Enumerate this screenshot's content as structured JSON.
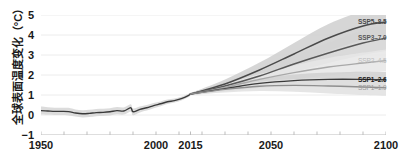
{
  "chart_data": {
    "type": "line",
    "title": "全球表面温度变化（°C）",
    "ylabel": "全球表面温度变化（°C）",
    "xlabel": "",
    "units": "°C",
    "xlim": [
      1950,
      2100
    ],
    "ylim": [
      -1,
      5
    ],
    "grid": true,
    "legend_position": "right",
    "x_ticks": [
      {
        "value": 1950,
        "label": "1950"
      },
      {
        "value": 2000,
        "label": "2000"
      },
      {
        "value": 2015,
        "label": "2015"
      },
      {
        "value": 2050,
        "label": "2050"
      },
      {
        "value": 2100,
        "label": "2100"
      }
    ],
    "x_minor_ticks": [
      1960,
      1970,
      1980,
      1990,
      2010,
      2020,
      2030,
      2040,
      2060,
      2070,
      2080,
      2090
    ],
    "y_ticks": [
      {
        "value": 5,
        "label": "5"
      },
      {
        "value": 4,
        "label": "4"
      },
      {
        "value": 3,
        "label": "3"
      },
      {
        "value": 2,
        "label": "2"
      },
      {
        "value": 1,
        "label": "1"
      },
      {
        "value": 0,
        "label": "0"
      },
      {
        "value": -1,
        "label": "−1"
      }
    ],
    "historical": {
      "name": "historical",
      "color": "#3a3a3a",
      "band_color": "#d6d6d6",
      "x": [
        1950,
        1953,
        1956,
        1959,
        1962,
        1965,
        1968,
        1971,
        1974,
        1977,
        1980,
        1983,
        1986,
        1989,
        1990,
        1993,
        1996,
        1999,
        2002,
        2005,
        2008,
        2011,
        2014,
        2015
      ],
      "values": [
        0.22,
        0.2,
        0.18,
        0.18,
        0.17,
        0.1,
        0.06,
        0.08,
        0.12,
        0.13,
        0.16,
        0.22,
        0.2,
        0.36,
        0.16,
        0.28,
        0.36,
        0.47,
        0.56,
        0.66,
        0.72,
        0.82,
        0.97,
        1.05
      ],
      "band_lower": [
        0.02,
        0.01,
        0.0,
        0.0,
        -0.02,
        -0.08,
        -0.12,
        -0.1,
        -0.06,
        -0.05,
        -0.02,
        0.04,
        0.02,
        0.18,
        -0.01,
        0.13,
        0.22,
        0.34,
        0.44,
        0.55,
        0.62,
        0.73,
        0.89,
        0.98
      ],
      "band_upper": [
        0.42,
        0.39,
        0.36,
        0.36,
        0.36,
        0.28,
        0.24,
        0.26,
        0.3,
        0.31,
        0.34,
        0.4,
        0.38,
        0.54,
        0.33,
        0.43,
        0.5,
        0.6,
        0.68,
        0.77,
        0.82,
        0.91,
        1.05,
        1.12
      ]
    },
    "series": [
      {
        "name": "SSP5-8.5",
        "label": "SSP5–8.5",
        "color": "#4a4a4a",
        "band_color": "#cfcfcf",
        "label_color": "#4a4a4a",
        "label_weight": "bold",
        "x": [
          2015,
          2030,
          2045,
          2060,
          2075,
          2090,
          2100
        ],
        "values": [
          1.05,
          1.55,
          2.25,
          3.05,
          3.85,
          4.45,
          4.65
        ],
        "band_lower": [
          1.0,
          1.35,
          1.9,
          2.55,
          3.2,
          3.75,
          3.95
        ],
        "band_upper": [
          1.1,
          1.78,
          2.62,
          3.6,
          4.55,
          5.2,
          5.45
        ],
        "end_value": 4.65
      },
      {
        "name": "SSP3-7.0",
        "label": "SSP3–7.0",
        "color": "#585858",
        "band_color": "#d4d4d4",
        "label_color": "#585858",
        "label_weight": "bold",
        "x": [
          2015,
          2030,
          2045,
          2060,
          2075,
          2090,
          2100
        ],
        "values": [
          1.05,
          1.45,
          1.95,
          2.55,
          3.1,
          3.6,
          3.85
        ],
        "band_lower": [
          1.0,
          1.28,
          1.68,
          2.15,
          2.6,
          3.0,
          3.2
        ],
        "band_upper": [
          1.1,
          1.65,
          2.25,
          2.95,
          3.62,
          4.22,
          4.52
        ],
        "end_value": 3.85
      },
      {
        "name": "SSP2-4.5",
        "label": "SSP2–4.5",
        "color": "#a8a8a8",
        "band_color": "#e6e6e6",
        "label_color": "#bdbdbd",
        "label_weight": "normal",
        "x": [
          2015,
          2030,
          2045,
          2060,
          2075,
          2090,
          2100
        ],
        "values": [
          1.05,
          1.38,
          1.78,
          2.12,
          2.4,
          2.6,
          2.72
        ],
        "band_lower": [
          1.0,
          1.22,
          1.52,
          1.78,
          1.98,
          2.12,
          2.2
        ],
        "band_upper": [
          1.1,
          1.55,
          2.05,
          2.48,
          2.85,
          3.12,
          3.28
        ],
        "end_value": 2.72
      },
      {
        "name": "SSP1-2.6",
        "label": "SSP1–2.6",
        "color": "#3a3a3a",
        "band_color": "#d0d0d0",
        "label_color": "#1a1a1a",
        "label_weight": "bold",
        "x": [
          2015,
          2030,
          2045,
          2060,
          2075,
          2090,
          2100
        ],
        "values": [
          1.05,
          1.32,
          1.58,
          1.72,
          1.78,
          1.78,
          1.76
        ],
        "band_lower": [
          1.0,
          1.18,
          1.35,
          1.45,
          1.45,
          1.42,
          1.38
        ],
        "band_upper": [
          1.1,
          1.48,
          1.82,
          2.02,
          2.12,
          2.16,
          2.16
        ],
        "end_value": 1.76
      },
      {
        "name": "SSP1-1.9",
        "label": "SSP1–1.9",
        "color": "#8f8f8f",
        "band_color": "#e0e0e0",
        "label_color": "#9a9a9a",
        "label_weight": "normal",
        "x": [
          2015,
          2030,
          2045,
          2060,
          2075,
          2090,
          2100
        ],
        "values": [
          1.05,
          1.28,
          1.44,
          1.48,
          1.45,
          1.4,
          1.36
        ],
        "band_lower": [
          1.0,
          1.12,
          1.2,
          1.16,
          1.08,
          1.0,
          0.96
        ],
        "band_upper": [
          1.1,
          1.44,
          1.68,
          1.8,
          1.82,
          1.8,
          1.78
        ],
        "end_value": 1.36
      }
    ]
  },
  "axis": {
    "y_title": "全球表面温度变化（°C）"
  },
  "colors": {
    "gridline": "#ececec",
    "axis": "#bdbdbd",
    "text": "#1a1a1a",
    "background": "#ffffff"
  }
}
